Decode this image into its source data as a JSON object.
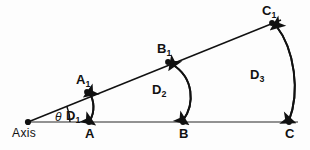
{
  "figure": {
    "name": "angular-displacement-wedge-diagram",
    "background_color": "#fdfdfd",
    "stroke_color": "#111111",
    "width": 310,
    "height": 150
  },
  "labels": {
    "axis": "Axis",
    "theta": "θ",
    "point_a": "A",
    "point_b": "B",
    "point_c": "C",
    "point_a1_base": "A",
    "point_a1_sub": "1",
    "point_b1_base": "B",
    "point_b1_sub": "1",
    "point_c1_base": "C",
    "point_c1_sub": "1",
    "d1_base": "D",
    "d1_sub": "1",
    "d2_base": "D",
    "d2_sub": "2",
    "d3_base": "D",
    "d3_sub": "3"
  },
  "geometry": {
    "apex": [
      28,
      122
    ],
    "baseline": [
      [
        28,
        122
      ],
      [
        298,
        122
      ]
    ],
    "upper_ray": [
      [
        28,
        122
      ],
      [
        280,
        20
      ]
    ],
    "points_on_baseline": {
      "A": [
        89,
        122
      ],
      "B": [
        183,
        122
      ],
      "C": [
        289,
        122
      ]
    },
    "points_on_ray": {
      "A1": [
        87,
        92
      ],
      "B1": [
        168,
        62
      ],
      "C1": [
        272,
        23
      ]
    },
    "arcs": {
      "D1": {
        "from": "A",
        "to": "A1",
        "arrowheads": "both"
      },
      "D2": {
        "from": "B",
        "to": "B1",
        "arrowheads": "both"
      },
      "D3": {
        "from": "C",
        "to": "C1",
        "arrowheads": "both"
      }
    }
  }
}
